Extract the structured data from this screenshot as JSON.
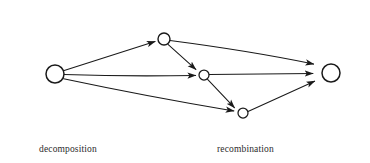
{
  "figure": {
    "type": "directed-graph-diagram",
    "background_color": "#ffffff",
    "stroke_color": "#1a1a1a",
    "text_color": "#2b2b2b"
  },
  "captions": {
    "left": "decomposition",
    "right": "recombination"
  },
  "nodes": [
    {
      "id": "source",
      "label": "",
      "cx": 55,
      "cy": 74,
      "r": 9.0,
      "role": "source-node"
    },
    {
      "id": "top",
      "label": "",
      "cx": 164,
      "cy": 39,
      "r": 6.0,
      "role": "intermediate-node"
    },
    {
      "id": "middle",
      "label": "",
      "cx": 204,
      "cy": 75,
      "r": 5.0,
      "role": "intermediate-node"
    },
    {
      "id": "bottom",
      "label": "",
      "cx": 243,
      "cy": 113,
      "r": 5.0,
      "role": "intermediate-node"
    },
    {
      "id": "sink",
      "label": "",
      "cx": 331,
      "cy": 73,
      "r": 9.0,
      "role": "sink-node"
    }
  ],
  "edges": [
    {
      "from": "source",
      "to": "top",
      "arrow": true,
      "phase": "decomposition"
    },
    {
      "from": "source",
      "to": "middle",
      "arrow": true,
      "phase": "decomposition"
    },
    {
      "from": "source",
      "to": "bottom",
      "arrow": true,
      "phase": "decomposition"
    },
    {
      "from": "top",
      "to": "middle",
      "arrow": true,
      "phase": "decomposition"
    },
    {
      "from": "middle",
      "to": "bottom",
      "arrow": true,
      "phase": "decomposition"
    },
    {
      "from": "top",
      "to": "sink",
      "arrow": true,
      "phase": "recombination"
    },
    {
      "from": "middle",
      "to": "sink",
      "arrow": true,
      "phase": "recombination"
    },
    {
      "from": "bottom",
      "to": "sink",
      "arrow": true,
      "phase": "recombination"
    }
  ]
}
